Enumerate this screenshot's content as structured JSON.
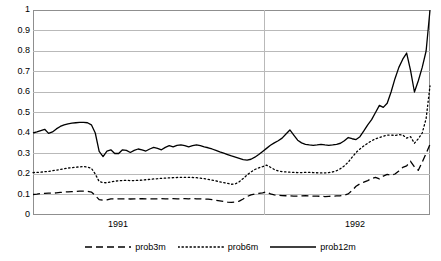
{
  "chart_data": {
    "type": "line",
    "title": "",
    "xlabel": "",
    "ylabel": "",
    "ylim": [
      0,
      1
    ],
    "yticks": [
      "0",
      "0.1",
      "0.2",
      "0.3",
      "0.4",
      "0.5",
      "0.6",
      "0.7",
      "0.8",
      "0.9",
      "1"
    ],
    "xticks": [
      "1991",
      "1992"
    ],
    "grid": "horizontal-gridlines-and-year-vertical-gridline",
    "legend_position": "bottom-center",
    "series": [
      {
        "name": "prob3m",
        "style": "dashed",
        "color": "#000000",
        "values": [
          0.1,
          0.102,
          0.105,
          0.105,
          0.107,
          0.106,
          0.108,
          0.11,
          0.112,
          0.113,
          0.114,
          0.115,
          0.116,
          0.116,
          0.115,
          0.112,
          0.095,
          0.075,
          0.072,
          0.074,
          0.079,
          0.078,
          0.079,
          0.079,
          0.079,
          0.078,
          0.079,
          0.079,
          0.08,
          0.079,
          0.079,
          0.079,
          0.079,
          0.08,
          0.079,
          0.079,
          0.08,
          0.079,
          0.079,
          0.08,
          0.079,
          0.08,
          0.079,
          0.079,
          0.078,
          0.077,
          0.075,
          0.072,
          0.069,
          0.066,
          0.063,
          0.062,
          0.063,
          0.068,
          0.078,
          0.09,
          0.098,
          0.103,
          0.105,
          0.108,
          0.113,
          0.103,
          0.098,
          0.096,
          0.095,
          0.094,
          0.093,
          0.092,
          0.092,
          0.093,
          0.094,
          0.093,
          0.092,
          0.092,
          0.091,
          0.09,
          0.091,
          0.092,
          0.093,
          0.094,
          0.097,
          0.103,
          0.12,
          0.14,
          0.152,
          0.16,
          0.168,
          0.178,
          0.184,
          0.176,
          0.19,
          0.198,
          0.194,
          0.2,
          0.215,
          0.232,
          0.24,
          0.262,
          0.235,
          0.218,
          0.258,
          0.3,
          0.345
        ]
      },
      {
        "name": "prob6m",
        "style": "dotted",
        "color": "#000000",
        "values": [
          0.207,
          0.208,
          0.209,
          0.211,
          0.213,
          0.216,
          0.219,
          0.222,
          0.226,
          0.229,
          0.231,
          0.233,
          0.235,
          0.236,
          0.234,
          0.228,
          0.2,
          0.163,
          0.158,
          0.157,
          0.162,
          0.165,
          0.167,
          0.168,
          0.169,
          0.168,
          0.168,
          0.169,
          0.17,
          0.172,
          0.174,
          0.176,
          0.177,
          0.179,
          0.18,
          0.181,
          0.182,
          0.183,
          0.184,
          0.184,
          0.184,
          0.183,
          0.182,
          0.18,
          0.177,
          0.174,
          0.17,
          0.166,
          0.162,
          0.158,
          0.154,
          0.15,
          0.152,
          0.162,
          0.178,
          0.195,
          0.21,
          0.222,
          0.23,
          0.236,
          0.243,
          0.233,
          0.222,
          0.215,
          0.212,
          0.21,
          0.209,
          0.208,
          0.207,
          0.207,
          0.208,
          0.208,
          0.207,
          0.206,
          0.205,
          0.205,
          0.207,
          0.21,
          0.216,
          0.226,
          0.24,
          0.258,
          0.282,
          0.305,
          0.322,
          0.337,
          0.35,
          0.362,
          0.372,
          0.378,
          0.384,
          0.39,
          0.39,
          0.388,
          0.392,
          0.39,
          0.375,
          0.382,
          0.35,
          0.372,
          0.4,
          0.47,
          0.63
        ]
      },
      {
        "name": "prob12m",
        "style": "solid",
        "color": "#000000",
        "values": [
          0.4,
          0.405,
          0.412,
          0.418,
          0.398,
          0.405,
          0.42,
          0.432,
          0.44,
          0.445,
          0.448,
          0.45,
          0.452,
          0.452,
          0.45,
          0.44,
          0.4,
          0.31,
          0.285,
          0.312,
          0.318,
          0.3,
          0.3,
          0.318,
          0.315,
          0.305,
          0.315,
          0.322,
          0.318,
          0.312,
          0.322,
          0.33,
          0.325,
          0.318,
          0.33,
          0.338,
          0.332,
          0.34,
          0.342,
          0.338,
          0.332,
          0.338,
          0.342,
          0.338,
          0.332,
          0.328,
          0.322,
          0.315,
          0.308,
          0.302,
          0.295,
          0.288,
          0.282,
          0.276,
          0.27,
          0.268,
          0.272,
          0.282,
          0.295,
          0.31,
          0.325,
          0.34,
          0.352,
          0.362,
          0.375,
          0.395,
          0.415,
          0.39,
          0.365,
          0.352,
          0.345,
          0.342,
          0.34,
          0.342,
          0.345,
          0.342,
          0.34,
          0.342,
          0.345,
          0.35,
          0.362,
          0.378,
          0.372,
          0.368,
          0.382,
          0.41,
          0.44,
          0.465,
          0.5,
          0.535,
          0.525,
          0.545,
          0.6,
          0.665,
          0.72,
          0.76,
          0.79,
          0.705,
          0.6,
          0.655,
          0.72,
          0.8,
          1.0
        ]
      }
    ]
  },
  "legend": {
    "items": [
      {
        "label": "prob3m",
        "style": "dashed"
      },
      {
        "label": "prob6m",
        "style": "dotted"
      },
      {
        "label": "prob12m",
        "style": "solid"
      }
    ]
  }
}
